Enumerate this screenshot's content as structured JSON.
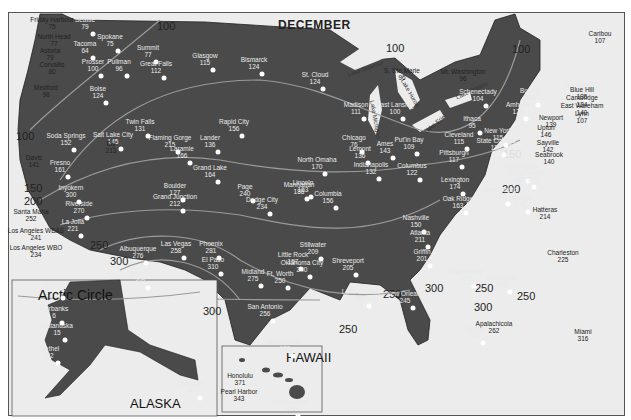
{
  "title": "DECEMBER",
  "insets": {
    "alaska": "ALASKA",
    "hawaii": "HAWAII",
    "arctic_circle": "Arctic Circle"
  },
  "lakes": [
    "Lake Superior",
    "Lake Michigan",
    "Lake Huron",
    "Lake Ontario",
    "Lake Erie"
  ],
  "isolines": [
    "100",
    "100",
    "100",
    "100",
    "150",
    "200",
    "150",
    "200",
    "250",
    "250",
    "300",
    "300",
    "250",
    "250",
    "300",
    "250",
    "300",
    "200"
  ],
  "stations": [
    {
      "name": "Friday Harbour",
      "value": "75"
    },
    {
      "name": "Seattle",
      "value": "79"
    },
    {
      "name": "North Head",
      "value": "77"
    },
    {
      "name": "Tacoma",
      "value": "64"
    },
    {
      "name": "Spokane",
      "value": "75"
    },
    {
      "name": "Astoria",
      "value": "79"
    },
    {
      "name": "Corvallis",
      "value": "80"
    },
    {
      "name": "Prosser",
      "value": "100"
    },
    {
      "name": "Pullman",
      "value": "96"
    },
    {
      "name": "Medford",
      "value": "98"
    },
    {
      "name": "Boise",
      "value": "124"
    },
    {
      "name": "Summit",
      "value": "77"
    },
    {
      "name": "Great Falls",
      "value": "112"
    },
    {
      "name": "Glasgow",
      "value": "115"
    },
    {
      "name": "Bismarck",
      "value": "124"
    },
    {
      "name": "St. Cloud",
      "value": "124"
    },
    {
      "name": "S. Ste Marie",
      "value": "96"
    },
    {
      "name": "Mt. Washington",
      "value": "96"
    },
    {
      "name": "Caribou",
      "value": "107"
    },
    {
      "name": "Portland",
      "value": "137"
    },
    {
      "name": "Boston",
      "value": "135"
    },
    {
      "name": "Schenectady",
      "value": "104"
    },
    {
      "name": "Amherst",
      "value": "125"
    },
    {
      "name": "Ithaca",
      "value": "95"
    },
    {
      "name": "Blue Hill",
      "value": "135"
    },
    {
      "name": "Cambridge",
      "value": "124"
    },
    {
      "name": "East Wareham",
      "value": "140"
    },
    {
      "name": "Lynn",
      "value": "107"
    },
    {
      "name": "Newport",
      "value": "139"
    },
    {
      "name": "Upton",
      "value": "146"
    },
    {
      "name": "Sayville",
      "value": "142"
    },
    {
      "name": "Seabrook",
      "value": "140"
    },
    {
      "name": "New York",
      "value": "115"
    },
    {
      "name": "State College",
      "value": "116"
    },
    {
      "name": "Cleveland",
      "value": "115"
    },
    {
      "name": "Pittsburgh",
      "value": "117"
    },
    {
      "name": "Washington",
      "value": "156"
    },
    {
      "name": "Mt. Weather",
      "value": "141,168"
    },
    {
      "name": "Madison",
      "value": "111"
    },
    {
      "name": "East Lansing",
      "value": "100"
    },
    {
      "name": "Put'in Bay",
      "value": "109"
    },
    {
      "name": "Chicago",
      "value": "76"
    },
    {
      "name": "Lemont",
      "value": "136"
    },
    {
      "name": "Indianapolis",
      "value": "132"
    },
    {
      "name": "Columbus",
      "value": "122"
    },
    {
      "name": "Lexington",
      "value": "174"
    },
    {
      "name": "Greensboro",
      "value": "182"
    },
    {
      "name": "Raleigh",
      "value": "178"
    },
    {
      "name": "Hatteras",
      "value": "214"
    },
    {
      "name": "Oak Ridge",
      "value": "163"
    },
    {
      "name": "Nashville",
      "value": "150"
    },
    {
      "name": "Atlanta",
      "value": "211"
    },
    {
      "name": "Griffin",
      "value": "201"
    },
    {
      "name": "Charleston",
      "value": "225"
    },
    {
      "name": "Tallahassee",
      "value": "239"
    },
    {
      "name": "Gainesville",
      "value": "233"
    },
    {
      "name": "Apalachicola",
      "value": "262"
    },
    {
      "name": "Tampa",
      "value": "307"
    },
    {
      "name": "Miami",
      "value": "316"
    },
    {
      "name": "New Orleans",
      "value": "245"
    },
    {
      "name": "Lake Charles",
      "value": "250"
    },
    {
      "name": "Shreveport",
      "value": "205"
    },
    {
      "name": "Little Rock",
      "value": "157"
    },
    {
      "name": "Columbia",
      "value": "156"
    },
    {
      "name": "Ames",
      "value": "143"
    },
    {
      "name": "North Omaha",
      "value": "170"
    },
    {
      "name": "Lincoln",
      "value": "163"
    },
    {
      "name": "Manhattan",
      "value": "186"
    },
    {
      "name": "Dodge City",
      "value": "234"
    },
    {
      "name": "Stillwater",
      "value": "209"
    },
    {
      "name": "Oklahoma City",
      "value": "240"
    },
    {
      "name": "Ft. Worth",
      "value": "250"
    },
    {
      "name": "San Antonio",
      "value": "256"
    },
    {
      "name": "Brownsville",
      "value": "283"
    },
    {
      "name": "Midland",
      "value": "275"
    },
    {
      "name": "El Paso",
      "value": "310"
    },
    {
      "name": "Albuquerque",
      "value": "276"
    },
    {
      "name": "Grand Junction",
      "value": "212"
    },
    {
      "name": "Boulder",
      "value": "127"
    },
    {
      "name": "Grand Lake",
      "value": "164"
    },
    {
      "name": "Laramie",
      "value": "166"
    },
    {
      "name": "Flaming Gorge",
      "value": "215"
    },
    {
      "name": "Lander",
      "value": "136"
    },
    {
      "name": "Rapid City",
      "value": "156"
    },
    {
      "name": "Twin Falls",
      "value": "131"
    },
    {
      "name": "Salt Lake City",
      "value": "145"
    },
    {
      "name": "Ely",
      "value": "213"
    },
    {
      "name": "Page",
      "value": "240"
    },
    {
      "name": "Las Vegas",
      "value": "258"
    },
    {
      "name": "Phoenix",
      "value": "281"
    },
    {
      "name": "Tucson",
      "value": "305"
    },
    {
      "name": "Soda Springs",
      "value": "152"
    },
    {
      "name": "Davis",
      "value": "141"
    },
    {
      "name": "Fresno",
      "value": "161"
    },
    {
      "name": "Inyokern",
      "value": "300"
    },
    {
      "name": "Riverside",
      "value": "270"
    },
    {
      "name": "La Jolla",
      "value": "221"
    },
    {
      "name": "Santa Maria",
      "value": "252"
    },
    {
      "name": "Los Angeles WBAS",
      "value": "241"
    },
    {
      "name": "Los Angeles WBO",
      "value": "234"
    },
    {
      "name": "Barrow",
      "value": ""
    },
    {
      "name": "Fairbanks",
      "value": "6"
    },
    {
      "name": "Matanuska",
      "value": "15"
    },
    {
      "name": "Bethel",
      "value": "22"
    },
    {
      "name": "Annette",
      "value": "41"
    },
    {
      "name": "Honolulu",
      "value": "371"
    },
    {
      "name": "Pearl Harbor",
      "value": "343"
    },
    {
      "name": "Mauna Loa",
      "value": "481"
    }
  ]
}
